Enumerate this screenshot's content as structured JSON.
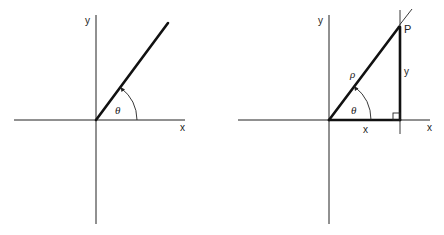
{
  "figure": {
    "panels": [
      {
        "id": "left",
        "description": "Ray from origin at angle theta",
        "labels": {
          "x_axis": "x",
          "y_axis": "y",
          "angle": "θ"
        }
      },
      {
        "id": "right",
        "description": "Polar coordinates: point P with radius rho, angle theta, legs x and y",
        "labels": {
          "x_axis": "x",
          "y_axis": "y",
          "angle": "θ",
          "radius": "ρ",
          "point": "P",
          "leg_x": "x",
          "leg_y": "y"
        }
      }
    ],
    "colors": {
      "line": "#111111",
      "background": "#ffffff"
    }
  }
}
